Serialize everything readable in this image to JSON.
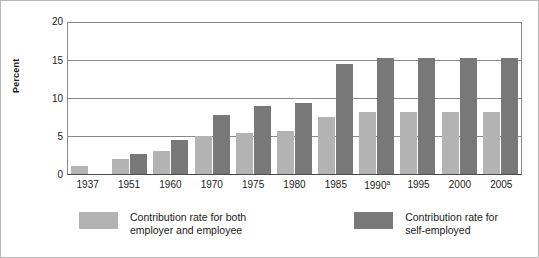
{
  "chart_data": {
    "type": "bar",
    "title": "",
    "xlabel": "",
    "ylabel": "Percent",
    "ylim": [
      0,
      20
    ],
    "yticks": [
      0,
      5,
      10,
      15,
      20
    ],
    "grid": true,
    "legend_position": "bottom",
    "categories": [
      "1937",
      "1951",
      "1960",
      "1970",
      "1975",
      "1980",
      "1985",
      "1990ᵃ",
      "1995",
      "2000",
      "2005"
    ],
    "category_notes": {
      "1990ᵃ": "a"
    },
    "series": [
      {
        "name": "Contribution rate for both employer and employee",
        "color": "#b3b3b3",
        "values": [
          1.0,
          2.0,
          3.0,
          5.0,
          5.4,
          5.6,
          7.5,
          8.1,
          8.1,
          8.1,
          8.1
        ]
      },
      {
        "name": "Contribution rate for self-employed",
        "color": "#787878",
        "values": [
          0,
          2.6,
          4.5,
          7.8,
          9.0,
          9.3,
          14.5,
          15.3,
          15.3,
          15.3,
          15.3
        ]
      }
    ]
  },
  "axis": {
    "y_title": "Percent",
    "y_tick_labels": [
      "20",
      "15",
      "10",
      "5",
      "0"
    ],
    "x_tick_labels": [
      "1937",
      "1951",
      "1960",
      "1970",
      "1975",
      "1980",
      "1985",
      "1990",
      "1995",
      "2000",
      "2005"
    ],
    "x_tick_superscripts": [
      "",
      "",
      "",
      "",
      "",
      "",
      "",
      "a",
      "",
      "",
      ""
    ]
  },
  "legend": {
    "entries": [
      {
        "swatch": "light",
        "label": "Contribution rate for both\nemployer and employee"
      },
      {
        "swatch": "dark",
        "label": "Contribution rate for\nself-employed"
      }
    ]
  }
}
